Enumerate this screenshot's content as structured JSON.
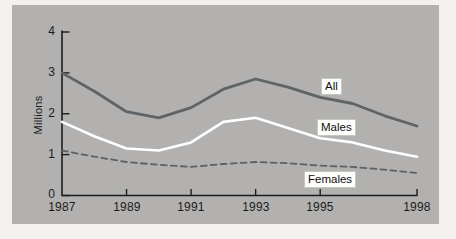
{
  "figure": {
    "y_axis_title": "Millions"
  },
  "chart_data": {
    "type": "line",
    "title": "",
    "xlabel": "",
    "ylabel": "Millions",
    "xlim": [
      1987,
      1998
    ],
    "ylim": [
      0,
      4
    ],
    "grid": false,
    "legend_position": "inline-labels-on-lines",
    "x": [
      1987,
      1988,
      1989,
      1990,
      1991,
      1992,
      1993,
      1994,
      1995,
      1996,
      1997,
      1998
    ],
    "series": [
      {
        "name": "All",
        "style": "solid",
        "color": "#5f6467",
        "width": 2.8,
        "values": [
          3.0,
          2.55,
          2.05,
          1.9,
          2.15,
          2.6,
          2.85,
          2.65,
          2.4,
          2.25,
          1.95,
          1.7
        ]
      },
      {
        "name": "Males",
        "style": "solid",
        "color": "#ffffff",
        "width": 2.6,
        "values": [
          1.8,
          1.45,
          1.15,
          1.1,
          1.3,
          1.8,
          1.9,
          1.65,
          1.4,
          1.3,
          1.1,
          0.95
        ]
      },
      {
        "name": "Females",
        "style": "dashed",
        "color": "#5d6165",
        "width": 1.8,
        "values": [
          1.1,
          0.95,
          0.82,
          0.75,
          0.7,
          0.77,
          0.82,
          0.79,
          0.73,
          0.7,
          0.63,
          0.55
        ]
      }
    ],
    "x_tick_years": [
      1987,
      1989,
      1991,
      1993,
      1995,
      1998
    ],
    "x_tick_labels": [
      "1987",
      "1989",
      "1991",
      "1993",
      "1995",
      "1998"
    ],
    "y_tick_values": [
      0,
      1,
      2,
      3,
      4
    ],
    "y_tick_labels_top_to_bottom": [
      "4",
      "3",
      "2",
      "1",
      "0"
    ],
    "colors": {
      "panel_background": "#b2b1af",
      "page_background": "#f2f1ed",
      "axis": "#1c1c1c",
      "label_box_background": "#fdfdfc"
    }
  }
}
